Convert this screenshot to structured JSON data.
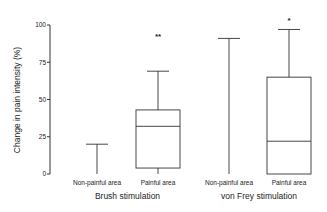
{
  "chart_data": {
    "type": "box",
    "title": "",
    "ylabel": "Change in pain intensity (%)",
    "xlabel": "",
    "ylim": [
      0,
      100
    ],
    "yticks": [
      0,
      25,
      50,
      75,
      100
    ],
    "grid": false,
    "categories": [
      "Non-painful area",
      "Painful area",
      "Non-painful area",
      "Painful area"
    ],
    "groups": [
      {
        "label": "Brush stimulation",
        "categories": [
          0,
          1
        ]
      },
      {
        "label": "von Frey stimulation",
        "categories": [
          2,
          3
        ]
      }
    ],
    "boxes": [
      {
        "category": "Non-painful area",
        "group": "Brush stimulation",
        "whisker_low": 0,
        "q1": 0,
        "median": 0,
        "q3": 0,
        "whisker_high": 20,
        "significance": ""
      },
      {
        "category": "Painful area",
        "group": "Brush stimulation",
        "whisker_low": 0,
        "q1": 4,
        "median": 32,
        "q3": 43,
        "whisker_high": 69,
        "significance": "**"
      },
      {
        "category": "Non-painful area",
        "group": "von Frey stimulation",
        "whisker_low": 0,
        "q1": 0,
        "median": 0,
        "q3": 0,
        "whisker_high": 91,
        "significance": ""
      },
      {
        "category": "Painful area",
        "group": "von Frey stimulation",
        "whisker_low": 0,
        "q1": 0,
        "median": 22,
        "q3": 65,
        "whisker_high": 97,
        "significance": "*"
      }
    ]
  }
}
